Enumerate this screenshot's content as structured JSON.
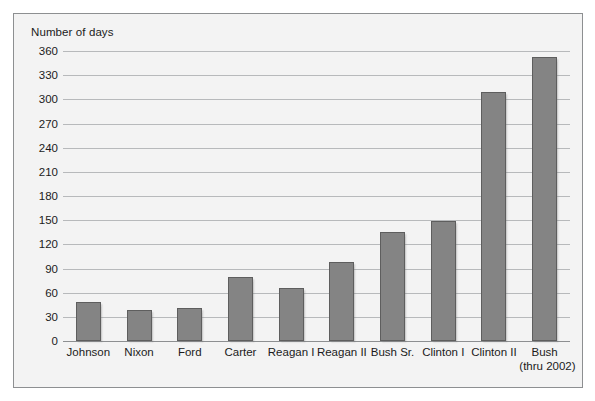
{
  "chart_data": {
    "type": "bar",
    "title": "",
    "subtitle": "",
    "xlabel": "",
    "ylabel": "Number of days",
    "ylim": [
      0,
      360
    ],
    "ytick_step": 30,
    "yticks": [
      360,
      330,
      300,
      270,
      240,
      210,
      180,
      150,
      120,
      90,
      60,
      30,
      0
    ],
    "grid": true,
    "legend": "none",
    "bar_color": "#848484",
    "bar_edge_color": "#5e5e5e",
    "plot_background": "#f3f3f3",
    "gridline_color": "#b7b9bb",
    "frame_color": "#8d8f91",
    "categories": [
      "Johnson",
      "Nixon",
      "Ford",
      "Carter",
      "Reagan I",
      "Reagan II",
      "Bush Sr.",
      "Clinton I",
      "Clinton II",
      "Bush"
    ],
    "category_sublabels": [
      "",
      "",
      "",
      "",
      "",
      "",
      "",
      "",
      "",
      "(thru 2002)"
    ],
    "values": [
      48,
      39,
      41,
      80,
      66,
      98,
      135,
      149,
      309,
      352
    ]
  }
}
